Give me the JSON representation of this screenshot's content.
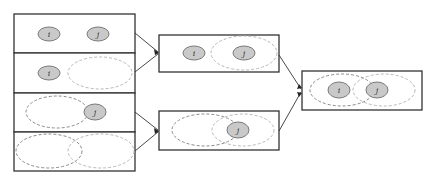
{
  "diagram": {
    "type": "set-merge-flow",
    "node_labels": {
      "i": "i",
      "j": "j"
    },
    "colors": {
      "box_stroke": "#333333",
      "node_fill": "#c9c9c9",
      "node_stroke": "#7a7a7a",
      "dashed_dark": "#8a8a8a",
      "dashed_light": "#b8b8b8"
    },
    "left_column": [
      {
        "id": "case-1",
        "description": "i and j as separate points",
        "labels": [
          "i",
          "j"
        ]
      },
      {
        "id": "case-2",
        "description": "point i and a cluster",
        "labels": [
          "i"
        ]
      },
      {
        "id": "case-3",
        "description": "cluster and point j",
        "labels": [
          "j"
        ]
      },
      {
        "id": "case-4",
        "description": "two overlapping clusters",
        "labels": []
      }
    ],
    "middle_column": [
      {
        "id": "merge-top",
        "description": "point i and cluster containing j",
        "labels": [
          "i",
          "j"
        ]
      },
      {
        "id": "merge-bottom",
        "description": "two clusters with j in overlap",
        "labels": [
          "j"
        ]
      }
    ],
    "right_column": [
      {
        "id": "result",
        "description": "two overlapping clusters containing i and j",
        "labels": [
          "i",
          "j"
        ]
      }
    ]
  }
}
